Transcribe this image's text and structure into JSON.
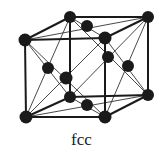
{
  "diagram": {
    "title": "fcc",
    "colors": {
      "atom": "#1a1a1a",
      "edge": "#1a1a1a",
      "diag": "#333333",
      "background": "#ffffff"
    },
    "corners": {
      "btl": [
        70,
        17
      ],
      "btr": [
        148,
        17
      ],
      "ftl": [
        25,
        40
      ],
      "ftr": [
        105,
        38
      ],
      "bbl": [
        70,
        97
      ],
      "bbr": [
        148,
        95
      ],
      "fbl": [
        26,
        117
      ],
      "fbr": [
        105,
        117
      ]
    },
    "face_centers": {
      "top": [
        87,
        26
      ],
      "bottom": [
        87,
        105
      ],
      "left": [
        48,
        68
      ],
      "front": [
        66,
        78
      ],
      "right": [
        128,
        66
      ],
      "back": [
        108,
        57
      ]
    }
  }
}
